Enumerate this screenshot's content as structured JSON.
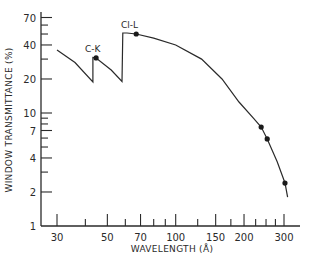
{
  "chart_data": {
    "type": "line",
    "title": "",
    "xlabel": "WAVELENGTH (Å)",
    "ylabel": "WINDOW TRANSMITTANCE (%)",
    "xscale": "log",
    "yscale": "log",
    "xlim": [
      25,
      330
    ],
    "ylim": [
      1,
      80
    ],
    "x_ticks": [
      30,
      50,
      70,
      100,
      150,
      200,
      300
    ],
    "y_ticks": [
      1,
      2,
      4,
      7,
      10,
      20,
      40,
      70
    ],
    "grid": false,
    "legend": null,
    "series": [
      {
        "name": "Window transmittance curve",
        "x": [
          30,
          36,
          43.2,
          43.2,
          44.6,
          52,
          58,
          58.5,
          61,
          67,
          80,
          100,
          130,
          160,
          190,
          220,
          238,
          253,
          280,
          303,
          311
        ],
        "y": [
          36,
          28,
          18.8,
          31,
          30.7,
          24,
          19,
          51,
          51,
          50,
          46,
          40,
          30,
          20,
          12.5,
          9,
          7.5,
          5.9,
          3.7,
          2.4,
          1.8
        ]
      },
      {
        "name": "Measured points",
        "x": [
          44.6,
          67,
          238,
          253,
          303
        ],
        "y": [
          30.7,
          50,
          7.5,
          5.9,
          2.4
        ]
      }
    ],
    "annotations": [
      {
        "text": "C-K",
        "x": 44.6,
        "y": 30.7
      },
      {
        "text": "Cl-L",
        "x": 67,
        "y": 50
      }
    ]
  },
  "labels": {
    "xlabel": "WAVELENGTH (Å)",
    "ylabel": "WINDOW TRANSMITTANCE (%)",
    "annot_ck": "C-K",
    "annot_cll": "Cl-L",
    "x_ticks": [
      "30",
      "50",
      "70",
      "100",
      "150",
      "200",
      "300"
    ],
    "y_ticks": [
      "1",
      "2",
      "4",
      "7",
      "10",
      "20",
      "40",
      "70"
    ]
  },
  "colors": {
    "ink": "#2a2a2a",
    "background": "#ffffff"
  }
}
